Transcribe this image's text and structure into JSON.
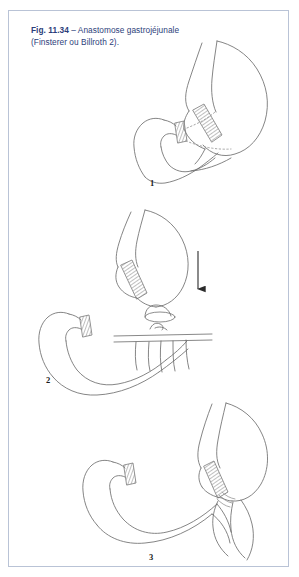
{
  "figure": {
    "reference": "Fig. 11.34",
    "dash": "–",
    "title_line1": "Anastomose",
    "title_line2": "gastrojéjunale (Finsterer",
    "title_line3": "ou Billroth 2).",
    "full_caption": "Fig. 11.34 – Anastomose gastrojéjunale (Finsterer ou Billroth 2).",
    "caption_color": "#2c3e7a",
    "frame_color": "#b9c3d6",
    "background_color": "#ffffff",
    "line_color": "#6f6f6f"
  },
  "panels": [
    {
      "number": "1",
      "description": "Estomac avec ligne de résection agrafée et moignon duodénal, tracés pointillés de la pièce réséquée"
    },
    {
      "number": "2",
      "description": "Moignon gastrique abaissé avec flèche, anse jéjunale passée à travers le mésocôlon transverse"
    },
    {
      "number": "3",
      "description": "Anastomose gastrojéjunale terminée"
    }
  ],
  "annotations": {
    "arrow_direction": "down",
    "staple_line_label": "ligne d'agrafage",
    "mesocolon_label": "mésocôlon transverse"
  }
}
